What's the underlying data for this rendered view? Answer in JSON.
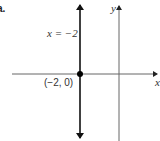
{
  "figure": {
    "part_label": "a.",
    "line_label": "x = −2",
    "point_label": "(−2, 0)",
    "axis_x_label": "x",
    "axis_y_label": "y"
  },
  "geometry": {
    "vertical_line_x": -2,
    "point": [
      -2,
      0
    ]
  },
  "colors": {
    "line": "#111111",
    "axis": "#555555",
    "text": "#333333"
  }
}
